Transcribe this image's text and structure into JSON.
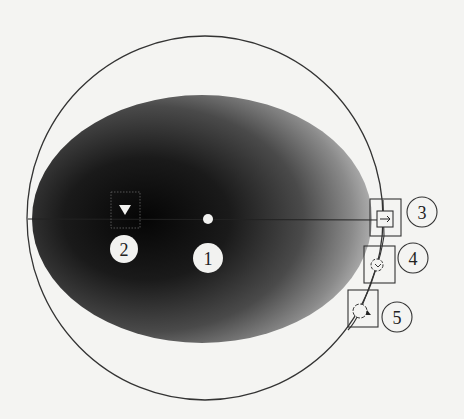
{
  "diagram": {
    "type": "field-of-view schematic",
    "colors": {
      "background": "#f4f4f2",
      "outline": "#333333",
      "shade_dark": "#0a0a0a",
      "shade_mid": "#5a5a5a",
      "shade_light": "#bdbdbd",
      "marker_fill": "#f2f2f0"
    },
    "callouts": [
      {
        "id": "1",
        "label": "1",
        "target": "center-dot"
      },
      {
        "id": "2",
        "label": "2",
        "target": "triangle-marker-box"
      },
      {
        "id": "3",
        "label": "3",
        "target": "arrow-box"
      },
      {
        "id": "4",
        "label": "4",
        "target": "rotation-ring-box"
      },
      {
        "id": "5",
        "label": "5",
        "target": "rotation-ring-arrow-box"
      }
    ],
    "icons": {
      "marker_2": "triangle-down-icon",
      "marker_3": "arrow-right-icon",
      "marker_4": "rotate-ring-icon",
      "marker_5": "rotate-arrow-icon"
    }
  }
}
